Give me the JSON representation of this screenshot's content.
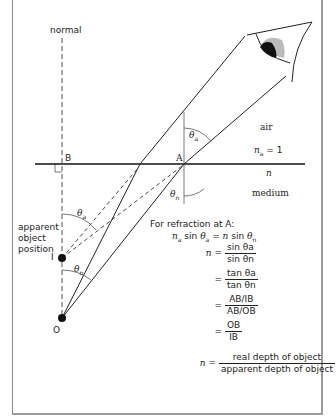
{
  "labels": {
    "normal": "normal",
    "B": "B",
    "A": "A",
    "I": "I",
    "O": "O",
    "air": "air",
    "na_eq": "= 1",
    "n_letter": "n",
    "na_letter": "n",
    "na_sub": "a",
    "n_medium": "n",
    "medium": "medium",
    "apparent_line1": "apparent",
    "apparent_line2": "object",
    "apparent_line3": "position",
    "theta": "θ",
    "sub_a": "a",
    "sub_n": "n"
  },
  "equations": {
    "intro": "For refraction at A:",
    "snell": {
      "left_n": "n",
      "left_sub": "a",
      "sin": "sin",
      "theta": "θ",
      "eq": "= ",
      "right_n": "n",
      "right_sin": "sin",
      "right_theta": "θ",
      "right_sub": "n"
    },
    "step1": {
      "lhs": "n =",
      "num": "sin θa",
      "den": "sin θn"
    },
    "step2": {
      "lhs": "=",
      "num": "tan θa",
      "den": "tan θn"
    },
    "step3": {
      "lhs": "=",
      "num": "AB/IB",
      "den": "AB/OB"
    },
    "step4": {
      "lhs": "=",
      "num": "OB",
      "den": "IB"
    },
    "step5": {
      "lhs": "n =",
      "num": "real depth of object",
      "den": "apparent depth of object"
    }
  }
}
